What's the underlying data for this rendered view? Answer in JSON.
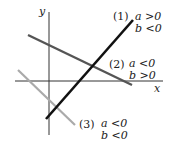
{
  "diagram": {
    "title": "",
    "axes": {
      "x_label": "x",
      "y_label": "y"
    },
    "lines": [
      {
        "id": "1",
        "tag": "(1)",
        "cond_a": "a >0",
        "cond_b": "b <0",
        "color": "#111111",
        "width": 2.6
      },
      {
        "id": "2",
        "tag": "(2)",
        "cond_a": "a <0",
        "cond_b": "b >0",
        "color": "#555555",
        "width": 2.4
      },
      {
        "id": "3",
        "tag": "(3)",
        "cond_a": "a <0",
        "cond_b": "b <0",
        "color": "#aaaaaa",
        "width": 2.2
      }
    ]
  }
}
